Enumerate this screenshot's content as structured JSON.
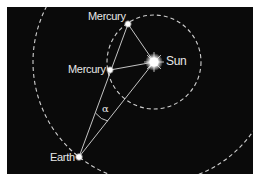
{
  "diagram": {
    "background_color": "#0a0a0a",
    "line_color": "#d8d8d8",
    "bodies": {
      "sun": {
        "label": "Sun",
        "x": 154,
        "y": 62
      },
      "mercury_top": {
        "label": "Mercury",
        "x": 128,
        "y": 24
      },
      "mercury_left": {
        "label": "Mercury",
        "x": 110,
        "y": 70
      },
      "earth": {
        "label": "Earth",
        "x": 79,
        "y": 157
      }
    },
    "orbits": {
      "mercury_orbit": {
        "cx": 154,
        "cy": 62,
        "r": 47,
        "style": "dashed"
      },
      "earth_orbit": {
        "cx": 154,
        "cy": 62,
        "r": 121,
        "style": "dashed"
      }
    },
    "angle": {
      "symbol": "α"
    }
  }
}
